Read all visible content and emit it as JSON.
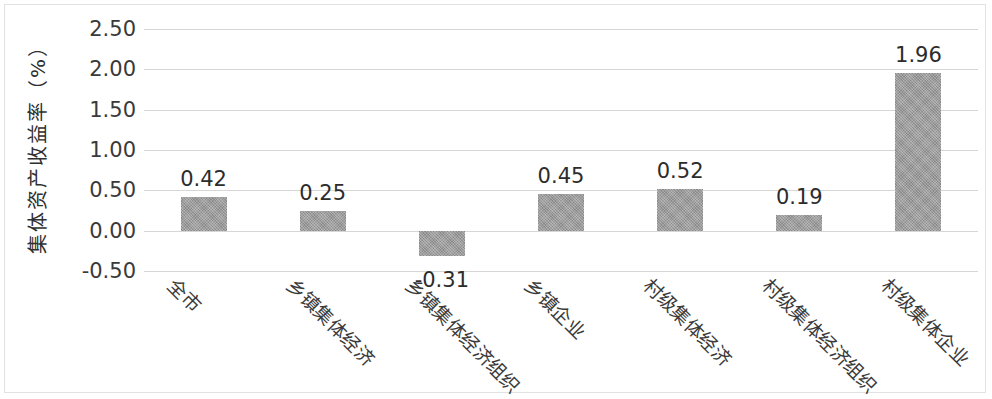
{
  "chart_data": {
    "type": "bar",
    "title": "",
    "subtitle": "",
    "xlabel": "",
    "ylabel": "集体资产收益率（%）",
    "ylim": [
      -0.5,
      2.5
    ],
    "ytick_labels": [
      "2.50",
      "2.00",
      "1.50",
      "1.00",
      "0.50",
      "0.00",
      "-0.50"
    ],
    "ytick_values": [
      2.5,
      2.0,
      1.5,
      1.0,
      0.5,
      0.0,
      -0.5
    ],
    "grid": true,
    "legend": "none",
    "categories": [
      "全市",
      "乡镇集体经济",
      "乡镇集体经济组织",
      "乡镇企业",
      "村级集体经济",
      "村级集体经济组织",
      "村级集体企业"
    ],
    "values": [
      0.42,
      0.25,
      -0.31,
      0.45,
      0.52,
      0.19,
      1.96
    ],
    "data_labels": [
      "0.42",
      "0.25",
      "-0.31",
      "0.45",
      "0.52",
      "0.19",
      "1.96"
    ],
    "bar_color": "#989898",
    "grid_color": "#d6d6d6",
    "text_color": "#2c2c2c"
  }
}
